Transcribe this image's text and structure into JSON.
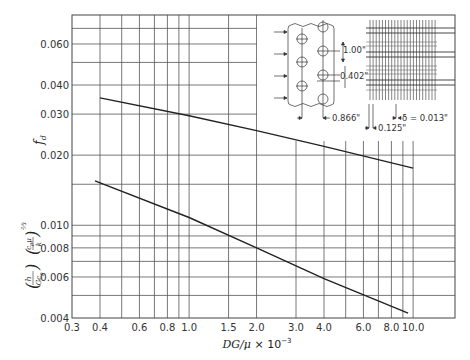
{
  "chart_data": {
    "type": "line",
    "title": "",
    "xscale": "log",
    "yscale": "log",
    "xlabel": "DG/μ × 10⁻³",
    "ylabel_upper": "f_d",
    "ylabel_lower": "(h/Gc_p)(c_pμ/k)^(2/3)",
    "xlim": [
      0.3,
      12.0
    ],
    "ylim": [
      0.004,
      0.08
    ],
    "grid": true,
    "x_ticks": [
      {
        "value": 0.3,
        "label": "0.3"
      },
      {
        "value": 0.4,
        "label": "0.4"
      },
      {
        "value": 0.6,
        "label": "0.6"
      },
      {
        "value": 0.8,
        "label": "0.8"
      },
      {
        "value": 1.0,
        "label": "1.0"
      },
      {
        "value": 1.5,
        "label": "1.5"
      },
      {
        "value": 2.0,
        "label": "2.0"
      },
      {
        "value": 3.0,
        "label": "3.0"
      },
      {
        "value": 4.0,
        "label": "4.0"
      },
      {
        "value": 6.0,
        "label": "6.0"
      },
      {
        "value": 8.0,
        "label": "8.0"
      },
      {
        "value": 10.0,
        "label": "10.0"
      }
    ],
    "x_gridlines": [
      0.4,
      0.5,
      0.6,
      0.7,
      0.8,
      0.9,
      1.0,
      1.5,
      2.0,
      3.0,
      4.0,
      5.0,
      6.0,
      7.0,
      8.0,
      9.0,
      10.0
    ],
    "y_ticks": [
      {
        "value": 0.004,
        "label": "0.004"
      },
      {
        "value": 0.006,
        "label": "0.006"
      },
      {
        "value": 0.008,
        "label": "0.008"
      },
      {
        "value": 0.01,
        "label": "0.010"
      },
      {
        "value": 0.02,
        "label": "0.020"
      },
      {
        "value": 0.03,
        "label": "0.030"
      },
      {
        "value": 0.04,
        "label": "0.040"
      },
      {
        "value": 0.06,
        "label": "0.060"
      }
    ],
    "y_gridlines": [
      0.005,
      0.006,
      0.007,
      0.008,
      0.009,
      0.01,
      0.015,
      0.02,
      0.03,
      0.04,
      0.05,
      0.06,
      0.07
    ],
    "series": [
      {
        "name": "f_d (friction factor)",
        "x": [
          0.4,
          1.0,
          2.0,
          4.0,
          10.0
        ],
        "y": [
          0.0352,
          0.0295,
          0.0255,
          0.0218,
          0.0176
        ]
      },
      {
        "name": "(h/Gc_p)(c_pμ/k)^(2/3) (Colburn j-factor)",
        "x": [
          0.38,
          1.0,
          2.0,
          4.0,
          9.5
        ],
        "y": [
          0.0155,
          0.0108,
          0.008,
          0.0059,
          0.0042
        ]
      }
    ],
    "inset": {
      "description": "Tube bank geometry sketch with fin detail",
      "dimensions": {
        "row_spacing": "1.00\"",
        "transverse_spacing": "0.402\"",
        "longitudinal_spacing": "0.866\"",
        "fin_pitch": "0.125\"",
        "fin_thickness": "δ = 0.013\""
      }
    }
  },
  "labels": {
    "xlabel_main": "DG/μ",
    "xlabel_suffix": " × 10",
    "xlabel_exp": "−3",
    "fd": "f",
    "fd_sub": "d",
    "j_h": "h",
    "j_gcp": "Gc",
    "j_gcp_sub": "p",
    "j_cpmu": "c",
    "j_cpmu_sub": "p",
    "j_mu": "μ",
    "j_k": "k",
    "j_exp": "⅔"
  }
}
